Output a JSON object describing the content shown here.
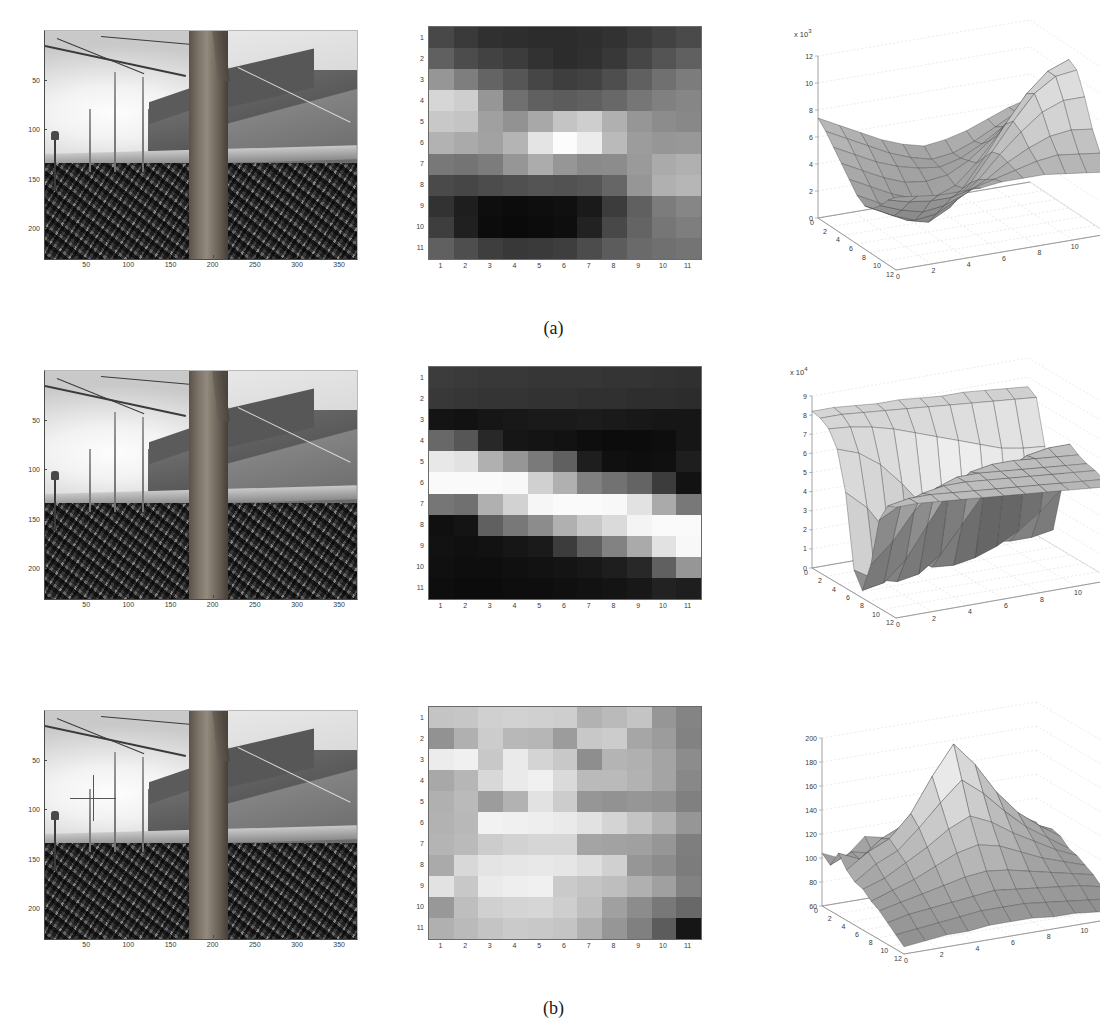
{
  "figure": {
    "caption_a": "(a)",
    "caption_b": "(b)",
    "caption_c": "(c)"
  },
  "photo": {
    "x_ticks": [
      "50",
      "100",
      "150",
      "200",
      "250",
      "300",
      "350"
    ],
    "y_ticks": [
      "50",
      "100",
      "150",
      "200"
    ],
    "x_values": [
      50,
      100,
      150,
      200,
      250,
      300,
      350
    ],
    "y_values": [
      50,
      100,
      150,
      200
    ],
    "x_range": [
      0,
      370
    ],
    "y_range": [
      0,
      230
    ],
    "description": "grayscale photograph of a large tree trunk in front of houses with a stone wall and leaf-covered ground",
    "marker_label": "crosshair-marker",
    "marker_x": 55,
    "marker_y": 100
  },
  "heatmap": {
    "x_ticks": [
      "1",
      "2",
      "3",
      "4",
      "5",
      "6",
      "7",
      "8",
      "9",
      "10",
      "11"
    ],
    "y_ticks": [
      "1",
      "2",
      "3",
      "4",
      "5",
      "6",
      "7",
      "8",
      "9",
      "10",
      "11"
    ],
    "rows": 11,
    "cols": 11
  },
  "surface": {
    "x_ticks": [
      "0",
      "2",
      "4",
      "6",
      "8",
      "10",
      "12"
    ],
    "y_ticks": [
      "0",
      "2",
      "4",
      "6",
      "8",
      "10",
      "12"
    ],
    "exponent_prefix": "x 10",
    "exponent_a": "3",
    "exponent_b": "4"
  },
  "chart_data": [
    {
      "type": "heatmap",
      "panel": "a",
      "title": "",
      "xlabel": "",
      "ylabel": "",
      "categories_x": [
        "1",
        "2",
        "3",
        "4",
        "5",
        "6",
        "7",
        "8",
        "9",
        "10",
        "11"
      ],
      "categories_y": [
        "1",
        "2",
        "3",
        "4",
        "5",
        "6",
        "7",
        "8",
        "9",
        "10",
        "11"
      ],
      "colormap": "gray",
      "vmin": 0,
      "vmax": 255,
      "values": [
        [
          72,
          58,
          48,
          46,
          44,
          44,
          46,
          50,
          58,
          66,
          74
        ],
        [
          96,
          76,
          66,
          60,
          50,
          44,
          48,
          56,
          70,
          84,
          96
        ],
        [
          150,
          126,
          100,
          86,
          70,
          62,
          66,
          78,
          96,
          112,
          124
        ],
        [
          214,
          206,
          150,
          112,
          96,
          92,
          96,
          104,
          118,
          128,
          134
        ],
        [
          200,
          196,
          160,
          146,
          168,
          196,
          206,
          176,
          150,
          140,
          136
        ],
        [
          178,
          170,
          162,
          180,
          228,
          252,
          236,
          186,
          156,
          150,
          152
        ],
        [
          120,
          116,
          124,
          150,
          172,
          150,
          138,
          140,
          154,
          170,
          176
        ],
        [
          74,
          70,
          76,
          80,
          84,
          82,
          86,
          102,
          150,
          176,
          182
        ],
        [
          50,
          30,
          14,
          12,
          14,
          16,
          26,
          60,
          96,
          124,
          134
        ],
        [
          62,
          32,
          12,
          10,
          12,
          14,
          34,
          72,
          100,
          118,
          126
        ],
        [
          96,
          78,
          62,
          56,
          58,
          62,
          76,
          92,
          106,
          112,
          116
        ]
      ]
    },
    {
      "type": "surface",
      "panel": "a",
      "title": "",
      "xlabel": "",
      "ylabel": "",
      "zlabel": "",
      "z_exponent": 3,
      "z_ticks": [
        0,
        2,
        4,
        6,
        8,
        10,
        12
      ],
      "zlim": [
        0,
        12
      ],
      "x_ticks": [
        0,
        2,
        4,
        6,
        8,
        10,
        12
      ],
      "y_ticks": [
        0,
        2,
        4,
        6,
        8,
        10,
        12
      ],
      "xlim": [
        0,
        12
      ],
      "ylim": [
        0,
        12
      ],
      "grid": true,
      "shading": "faceted gray",
      "values": [
        [
          7.4,
          6.6,
          5.8,
          5.0,
          4.4,
          4.0,
          4.2,
          4.6,
          5.2,
          5.8,
          6.2
        ],
        [
          6.8,
          6.0,
          5.2,
          4.4,
          3.8,
          3.4,
          3.6,
          4.2,
          5.0,
          5.8,
          6.4
        ],
        [
          6.0,
          5.2,
          4.4,
          3.8,
          3.4,
          3.2,
          3.6,
          4.4,
          5.4,
          6.4,
          7.2
        ],
        [
          5.2,
          4.4,
          3.6,
          3.0,
          2.8,
          3.0,
          3.8,
          5.0,
          6.4,
          7.6,
          8.4
        ],
        [
          4.4,
          3.6,
          2.8,
          2.2,
          2.0,
          2.6,
          4.0,
          5.8,
          7.6,
          9.0,
          9.8
        ],
        [
          3.6,
          2.8,
          2.0,
          1.4,
          1.6,
          2.8,
          4.8,
          7.0,
          9.0,
          10.4,
          11.0
        ],
        [
          3.2,
          2.4,
          1.6,
          1.2,
          2.0,
          3.6,
          5.6,
          7.6,
          9.4,
          10.4,
          10.6
        ],
        [
          3.4,
          2.6,
          2.0,
          2.2,
          3.0,
          4.2,
          5.8,
          7.2,
          8.4,
          9.0,
          9.0
        ],
        [
          4.0,
          3.4,
          3.0,
          3.2,
          3.8,
          4.6,
          5.6,
          6.4,
          7.0,
          7.2,
          7.0
        ],
        [
          4.8,
          4.4,
          4.2,
          4.2,
          4.6,
          5.0,
          5.4,
          5.8,
          6.0,
          5.8,
          5.6
        ],
        [
          5.4,
          5.2,
          5.0,
          5.0,
          5.0,
          5.2,
          5.2,
          5.2,
          5.0,
          4.8,
          4.6
        ]
      ]
    },
    {
      "type": "heatmap",
      "panel": "b",
      "title": "",
      "xlabel": "",
      "ylabel": "",
      "categories_x": [
        "1",
        "2",
        "3",
        "4",
        "5",
        "6",
        "7",
        "8",
        "9",
        "10",
        "11"
      ],
      "categories_y": [
        "1",
        "2",
        "3",
        "4",
        "5",
        "6",
        "7",
        "8",
        "9",
        "10",
        "11"
      ],
      "colormap": "gray",
      "vmin": 0,
      "vmax": 255,
      "values": [
        [
          60,
          58,
          56,
          56,
          54,
          54,
          54,
          52,
          52,
          50,
          48
        ],
        [
          56,
          54,
          52,
          52,
          50,
          50,
          48,
          48,
          46,
          46,
          44
        ],
        [
          20,
          18,
          22,
          24,
          26,
          26,
          28,
          26,
          24,
          22,
          22
        ],
        [
          104,
          86,
          40,
          22,
          20,
          18,
          14,
          12,
          12,
          14,
          22
        ],
        [
          232,
          226,
          176,
          150,
          122,
          96,
          30,
          16,
          14,
          16,
          30
        ],
        [
          250,
          250,
          250,
          248,
          208,
          176,
          128,
          114,
          100,
          60,
          18
        ],
        [
          118,
          112,
          176,
          210,
          246,
          250,
          250,
          248,
          226,
          170,
          120
        ],
        [
          16,
          20,
          96,
          120,
          140,
          176,
          200,
          218,
          244,
          250,
          250
        ],
        [
          18,
          16,
          18,
          22,
          26,
          60,
          96,
          130,
          170,
          226,
          248
        ],
        [
          16,
          14,
          14,
          16,
          18,
          20,
          24,
          30,
          40,
          96,
          150
        ],
        [
          14,
          12,
          12,
          14,
          14,
          16,
          18,
          20,
          24,
          34,
          30
        ]
      ]
    },
    {
      "type": "surface",
      "panel": "b",
      "title": "",
      "xlabel": "",
      "ylabel": "",
      "zlabel": "",
      "z_exponent": 4,
      "z_ticks": [
        0,
        1,
        2,
        3,
        4,
        5,
        6,
        7,
        8,
        9
      ],
      "zlim": [
        0,
        9
      ],
      "x_ticks": [
        0,
        2,
        4,
        6,
        8,
        10,
        12
      ],
      "y_ticks": [
        0,
        2,
        4,
        6,
        8,
        10,
        12
      ],
      "xlim": [
        0,
        12
      ],
      "ylim": [
        0,
        12
      ],
      "grid": true,
      "shading": "faceted gray",
      "values": [
        [
          8.2,
          8.2,
          8.1,
          8.0,
          8.0,
          7.9,
          7.8,
          7.8,
          7.7,
          7.6,
          7.5
        ],
        [
          8.1,
          8.1,
          8.0,
          7.9,
          7.8,
          7.7,
          7.6,
          7.5,
          7.4,
          7.3,
          7.2
        ],
        [
          7.8,
          7.7,
          7.5,
          7.2,
          6.8,
          6.4,
          6.0,
          5.6,
          5.2,
          5.0,
          4.9
        ],
        [
          7.0,
          6.6,
          5.8,
          4.6,
          3.2,
          2.0,
          1.2,
          0.8,
          0.6,
          0.6,
          0.8
        ],
        [
          5.0,
          4.0,
          2.4,
          1.0,
          0.3,
          0.2,
          0.4,
          0.8,
          1.4,
          2.2,
          3.2
        ],
        [
          1.2,
          0.5,
          0.2,
          0.4,
          1.2,
          2.6,
          4.0,
          5.0,
          5.6,
          5.8,
          5.8
        ],
        [
          0.4,
          0.6,
          1.6,
          3.2,
          4.8,
          5.6,
          5.8,
          5.8,
          5.7,
          5.6,
          5.5
        ],
        [
          2.0,
          3.0,
          4.4,
          5.4,
          5.8,
          5.8,
          5.7,
          5.6,
          5.5,
          5.4,
          5.3
        ],
        [
          4.6,
          5.2,
          5.6,
          5.8,
          5.8,
          5.7,
          5.6,
          5.5,
          5.4,
          5.3,
          5.2
        ],
        [
          5.6,
          5.8,
          5.8,
          5.7,
          5.6,
          5.5,
          5.4,
          5.3,
          5.2,
          5.1,
          5.0
        ],
        [
          5.8,
          5.8,
          5.7,
          5.6,
          5.5,
          5.4,
          5.3,
          5.2,
          5.1,
          5.0,
          4.9
        ]
      ]
    },
    {
      "type": "heatmap",
      "panel": "c",
      "title": "",
      "xlabel": "",
      "ylabel": "",
      "categories_x": [
        "1",
        "2",
        "3",
        "4",
        "5",
        "6",
        "7",
        "8",
        "9",
        "10",
        "11"
      ],
      "categories_y": [
        "1",
        "2",
        "3",
        "4",
        "5",
        "6",
        "7",
        "8",
        "9",
        "10",
        "11"
      ],
      "colormap": "gray",
      "vmin": 0,
      "vmax": 255,
      "values": [
        [
          196,
          198,
          208,
          210,
          208,
          206,
          178,
          186,
          196,
          150,
          132
        ],
        [
          146,
          176,
          204,
          184,
          182,
          156,
          200,
          204,
          166,
          156,
          130
        ],
        [
          236,
          240,
          200,
          234,
          212,
          200,
          142,
          180,
          176,
          164,
          140
        ],
        [
          168,
          182,
          216,
          234,
          240,
          218,
          186,
          186,
          178,
          164,
          136
        ],
        [
          176,
          186,
          156,
          178,
          226,
          204,
          150,
          146,
          150,
          146,
          128
        ],
        [
          178,
          184,
          242,
          240,
          238,
          234,
          226,
          212,
          196,
          178,
          150
        ],
        [
          180,
          186,
          204,
          210,
          214,
          214,
          164,
          162,
          160,
          150,
          126
        ],
        [
          170,
          216,
          228,
          230,
          232,
          230,
          222,
          208,
          150,
          140,
          124
        ],
        [
          226,
          200,
          234,
          238,
          240,
          202,
          196,
          190,
          176,
          160,
          130
        ],
        [
          152,
          190,
          208,
          212,
          214,
          206,
          190,
          160,
          140,
          120,
          104
        ],
        [
          176,
          186,
          196,
          202,
          200,
          196,
          176,
          150,
          128,
          92,
          22
        ]
      ]
    },
    {
      "type": "surface",
      "panel": "c",
      "title": "",
      "xlabel": "",
      "ylabel": "",
      "zlabel": "",
      "z_exponent": 0,
      "z_ticks": [
        60,
        80,
        100,
        120,
        140,
        160,
        180,
        200
      ],
      "zlim": [
        60,
        200
      ],
      "x_ticks": [
        0,
        2,
        4,
        6,
        8,
        10,
        12
      ],
      "y_ticks": [
        0,
        2,
        4,
        6,
        8,
        10,
        12
      ],
      "xlim": [
        0,
        12
      ],
      "ylim": [
        0,
        12
      ],
      "grid": true,
      "shading": "faceted gray",
      "values": [
        [
          104,
          96,
          112,
          108,
          118,
          124,
          120,
          126,
          118,
          110,
          100
        ],
        [
          98,
          106,
          102,
          116,
          122,
          130,
          126,
          120,
          114,
          106,
          96
        ],
        [
          112,
          104,
          118,
          126,
          142,
          158,
          150,
          134,
          120,
          110,
          102
        ],
        [
          102,
          114,
          122,
          140,
          168,
          192,
          172,
          146,
          126,
          112,
          100
        ],
        [
          96,
          108,
          116,
          132,
          150,
          166,
          152,
          134,
          118,
          106,
          94
        ],
        [
          94,
          100,
          110,
          120,
          132,
          140,
          132,
          120,
          110,
          100,
          92
        ],
        [
          88,
          94,
          100,
          108,
          116,
          120,
          116,
          108,
          100,
          94,
          88
        ],
        [
          84,
          88,
          92,
          96,
          100,
          102,
          100,
          96,
          92,
          88,
          84
        ],
        [
          78,
          82,
          84,
          86,
          88,
          90,
          88,
          86,
          84,
          82,
          78
        ],
        [
          72,
          74,
          76,
          78,
          80,
          80,
          80,
          78,
          76,
          74,
          72
        ],
        [
          66,
          68,
          70,
          70,
          72,
          72,
          72,
          70,
          70,
          68,
          66
        ]
      ]
    }
  ]
}
